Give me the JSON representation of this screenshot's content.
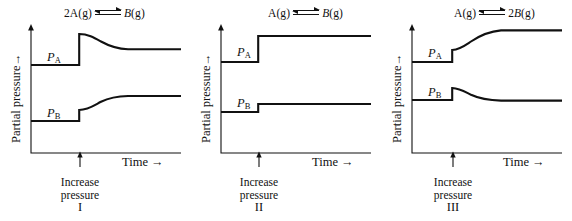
{
  "figure": {
    "type": "line",
    "background": "#ffffff",
    "ink_color": "#111111",
    "axis": {
      "ylabel": "Partial pressure",
      "ylabel_arrow": "→",
      "xlabel": "Time",
      "xlabel_arrow": "→",
      "grid": false,
      "ticks": false
    },
    "annotation": {
      "line1": "Increase",
      "line2": "pressure",
      "arrow": "↑"
    }
  },
  "panels": [
    {
      "id": "I",
      "roman": "I",
      "equation": {
        "left_coeff": "2",
        "left_species": "A",
        "left_state": "(g)",
        "arrow": "⇌",
        "right_coeff": "",
        "right_species": "B",
        "right_state": "(g)",
        "text": "2A(g) ⇌ B(g)"
      },
      "ylabel": "Partial pressure",
      "xlabel": "Time",
      "annotation_line1": "Increase",
      "annotation_line2": "pressure",
      "series": [
        {
          "name": "P_A",
          "label_base": "P",
          "label_sub": "A",
          "initial_level": 65,
          "jump_level": 34,
          "final_level": 48,
          "behavior": "jump-up-then-decay"
        },
        {
          "name": "P_B",
          "label_base": "P",
          "label_sub": "B",
          "initial_level": 121,
          "jump_level": 110,
          "final_level": 96,
          "behavior": "jump-up-then-rise"
        }
      ]
    },
    {
      "id": "II",
      "roman": "II",
      "equation": {
        "left_coeff": "",
        "left_species": "A",
        "left_state": "(g)",
        "arrow": "⇌",
        "right_coeff": "",
        "right_species": "B",
        "right_state": "(g)",
        "text": "A(g) ⇌ B(g)"
      },
      "ylabel": "Partial pressure",
      "xlabel": "Time",
      "annotation_line1": "Increase",
      "annotation_line2": "pressure",
      "series": [
        {
          "name": "P_A",
          "label_base": "P",
          "label_sub": "A",
          "initial_level": 62,
          "jump_level": 36,
          "final_level": 36,
          "behavior": "jump-up-then-flat"
        },
        {
          "name": "P_B",
          "label_base": "P",
          "label_sub": "B",
          "initial_level": 112,
          "jump_level": 104,
          "final_level": 104,
          "behavior": "jump-up-then-flat"
        }
      ]
    },
    {
      "id": "III",
      "roman": "III",
      "equation": {
        "left_coeff": "",
        "left_species": "A",
        "left_state": "(g)",
        "arrow": "⇌",
        "right_coeff": "2",
        "right_species": "B",
        "right_state": "(g)",
        "text": "A(g) ⇌ 2B(g)"
      },
      "ylabel": "Partial pressure",
      "xlabel": "Time",
      "annotation_line1": "Increase",
      "annotation_line2": "pressure",
      "series": [
        {
          "name": "P_A",
          "label_base": "P",
          "label_sub": "A",
          "initial_level": 62,
          "jump_level": 50,
          "final_level": 30,
          "behavior": "jump-up-then-rise"
        },
        {
          "name": "P_B",
          "label_base": "P",
          "label_sub": "B",
          "initial_level": 100,
          "jump_level": 88,
          "final_level": 100,
          "behavior": "jump-up-then-decay"
        }
      ]
    }
  ]
}
